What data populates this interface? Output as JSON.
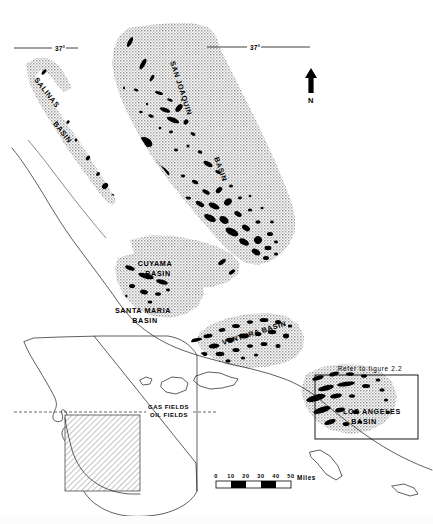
{
  "figure": {
    "north_arrow_label": "N",
    "refer_note": "Refer to figure 2.2"
  },
  "basins": [
    {
      "id": "salinas",
      "name_line1": "SALINAS",
      "name_line2": "BASIN"
    },
    {
      "id": "san-joaquin",
      "name_line1": "SAN JOAQUIN",
      "name_line2": "BASIN"
    },
    {
      "id": "cuyama",
      "name_line1": "CUYAMA",
      "name_line2": "BASIN"
    },
    {
      "id": "santa-maria",
      "name_line1": "SANTA MARIA",
      "name_line2": "BASIN"
    },
    {
      "id": "ventura",
      "name_line1": "VENTURA BASIN",
      "name_line2": ""
    },
    {
      "id": "los-angeles",
      "name_line1": "LOS ANGELES",
      "name_line2": "BASIN"
    }
  ],
  "graticule": {
    "left_tick_label": "37°",
    "right_tick_label": "37°"
  },
  "legend": {
    "gas_fields": "GAS FIELDS",
    "oil_fields": "OIL FIELDS"
  },
  "scale_bar": {
    "ticks": [
      "0",
      "10",
      "20",
      "30",
      "40",
      "50"
    ],
    "unit": "Miles"
  },
  "colors": {
    "basin_fill": "#b8b8b8",
    "oil_field": "#000000",
    "coastline": "#1a1a1a",
    "background": "#ffffff"
  }
}
